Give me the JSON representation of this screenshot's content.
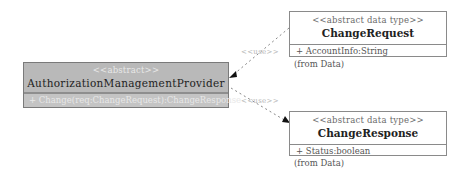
{
  "diagram": {
    "type": "UML class diagram",
    "classes": [
      {
        "id": "provider",
        "stereotype": "<<abstract>>",
        "name": "AuthorizationManagementProvider",
        "members": [
          "+ Change(req:ChangeRequest):ChangeResponse"
        ],
        "fill": "#b9b9b9"
      },
      {
        "id": "req",
        "stereotype": "<<abstract data type>>",
        "name": "ChangeRequest",
        "members": [
          "+ AccountInfo:String"
        ],
        "package_note": "(from Data)",
        "fill": "#ffffff"
      },
      {
        "id": "resp",
        "stereotype": "<<abstract data type>>",
        "name": "ChangeResponse",
        "members": [
          "+ Status:boolean"
        ],
        "package_note": "(from Data)",
        "fill": "#ffffff"
      }
    ],
    "relations": [
      {
        "from": "provider",
        "to": "req",
        "label": "<<use>>",
        "style": "dashed-arrow"
      },
      {
        "from": "provider",
        "to": "resp",
        "label": "<<use>>",
        "style": "dashed-arrow"
      }
    ]
  }
}
